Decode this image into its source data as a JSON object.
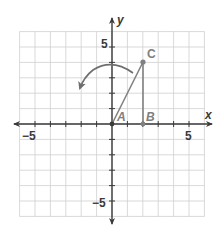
{
  "diagram": {
    "type": "coordinate-plane",
    "grid": {
      "xmin": -6,
      "xmax": 6,
      "ymin": -6,
      "ymax": 6,
      "step": 1
    },
    "axes": {
      "x_label": "x",
      "y_label": "y",
      "x_ticks": [
        {
          "value": -5,
          "label": "−5"
        },
        {
          "value": 5,
          "label": "5"
        }
      ],
      "y_ticks": [
        {
          "value": 5,
          "label": "5"
        },
        {
          "value": -5,
          "label": "−5"
        }
      ]
    },
    "points": [
      {
        "name": "A",
        "x": 0,
        "y": 0
      },
      {
        "name": "B",
        "x": 2,
        "y": 0
      },
      {
        "name": "C",
        "x": 2,
        "y": 4
      }
    ],
    "segments": [
      {
        "from": "A",
        "to": "C"
      },
      {
        "from": "B",
        "to": "C"
      }
    ],
    "annotation": "counterclockwise rotation arrow about origin",
    "colors": {
      "grid": "#c8c8c8",
      "axis": "#3a3a3a",
      "figure": "#808080",
      "text": "#3a3a3a"
    }
  }
}
